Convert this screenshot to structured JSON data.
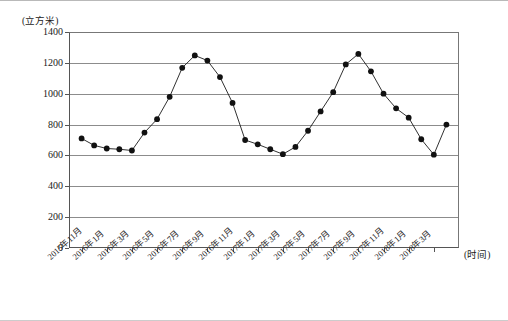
{
  "chart_data": {
    "type": "line",
    "title": "",
    "subtitle": "",
    "xlabel": "(时间)",
    "ylabel": "(立方米)",
    "ylim": [
      0,
      1400
    ],
    "yticks": [
      0,
      200,
      400,
      600,
      800,
      1000,
      1200,
      1400
    ],
    "grid": true,
    "legend": null,
    "marker": "filled-circle",
    "xtick_labels": [
      "2015年11月",
      "2016年1月",
      "2016年3月",
      "2016年5月",
      "2016年7月",
      "2016年9月",
      "2016年11月",
      "2017年1月",
      "2017年3月",
      "2017年5月",
      "2017年7月",
      "2017年9月",
      "2017年11月",
      "2018年1月",
      "2018年3月"
    ],
    "x": [
      "2015年11月",
      "2015年12月",
      "2016年1月",
      "2016年2月",
      "2016年3月",
      "2016年4月",
      "2016年5月",
      "2016年6月",
      "2016年7月",
      "2016年8月",
      "2016年9月",
      "2016年10月",
      "2016年11月",
      "2016年12月",
      "2017年1月",
      "2017年2月",
      "2017年3月",
      "2017年4月",
      "2017年5月",
      "2017年6月",
      "2017年7月",
      "2017年8月",
      "2017年9月",
      "2017年10月",
      "2017年11月",
      "2017年12月",
      "2018年1月",
      "2018年2月",
      "2018年3月",
      "2018年4月"
    ],
    "values": [
      710,
      665,
      645,
      640,
      632,
      748,
      835,
      980,
      1168,
      1248,
      1215,
      1108,
      940,
      700,
      672,
      640,
      608,
      655,
      760,
      885,
      1010,
      1190,
      1258,
      1145,
      1000,
      905,
      845,
      705,
      605,
      800
    ]
  }
}
